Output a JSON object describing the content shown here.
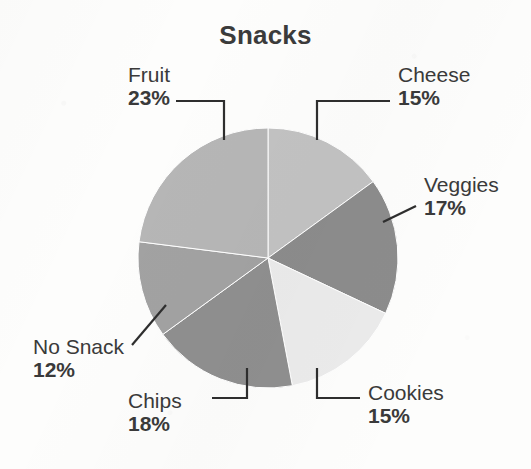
{
  "chart_data": {
    "type": "pie",
    "title": "Snacks",
    "xlabel": "",
    "ylabel": "",
    "legend_position": "none",
    "grid": false,
    "units": "percent",
    "total": 100,
    "start_angle_deg": 0,
    "direction": "clockwise",
    "categories": [
      "Cheese",
      "Veggies",
      "Cookies",
      "Chips",
      "No Snack",
      "Fruit"
    ],
    "values": [
      15,
      17,
      15,
      18,
      12,
      23
    ],
    "slices": [
      {
        "label": "Cheese",
        "value": 15,
        "display_value": "15%",
        "color": "#c2c2c2",
        "label_x": 398,
        "label_y": 64,
        "label_align": "left"
      },
      {
        "label": "Veggies",
        "value": 17,
        "display_value": "17%",
        "color": "#8c8c8c",
        "label_x": 424,
        "label_y": 174,
        "label_align": "left"
      },
      {
        "label": "Cookies",
        "value": 15,
        "display_value": "15%",
        "color": "#ebebeb",
        "label_x": 368,
        "label_y": 382,
        "label_align": "left"
      },
      {
        "label": "Chips",
        "value": 18,
        "display_value": "18%",
        "color": "#8f8f8f",
        "label_x": 128,
        "label_y": 390,
        "label_align": "left"
      },
      {
        "label": "No Snack",
        "value": 12,
        "display_value": "12%",
        "color": "#a2a2a2",
        "label_x": 33,
        "label_y": 336,
        "label_align": "left"
      },
      {
        "label": "Fruit",
        "value": 23,
        "display_value": "23%",
        "color": "#b6b6b6",
        "label_x": 128,
        "label_y": 64,
        "label_align": "left"
      }
    ],
    "geometry": {
      "center_x": 268,
      "center_y": 258,
      "radius": 130
    },
    "style": {
      "background": "#fdfdfc",
      "title_color": "#3b3b3b",
      "label_color": "#3a3a3a",
      "leader_color": "#2e2e2e",
      "slice_edge_color": "#ffffff"
    }
  }
}
